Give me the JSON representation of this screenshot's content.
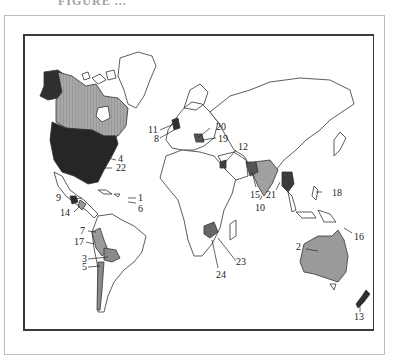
{
  "header": {
    "text": "FIGURE ..."
  },
  "map": {
    "title": "World map with numbered countries",
    "shading": {
      "dark": "#2b2b2b",
      "medium": "#8a8a8a",
      "light": "#b5b5b5",
      "outline": "#333333"
    },
    "labels": [
      {
        "id": "1",
        "text": "1"
      },
      {
        "id": "2",
        "text": "2"
      },
      {
        "id": "3",
        "text": "3"
      },
      {
        "id": "4",
        "text": "4"
      },
      {
        "id": "5",
        "text": "5"
      },
      {
        "id": "6",
        "text": "6"
      },
      {
        "id": "7",
        "text": "7"
      },
      {
        "id": "8",
        "text": "8"
      },
      {
        "id": "9",
        "text": "9"
      },
      {
        "id": "10",
        "text": "10"
      },
      {
        "id": "11",
        "text": "11"
      },
      {
        "id": "12",
        "text": "12"
      },
      {
        "id": "13",
        "text": "13"
      },
      {
        "id": "14",
        "text": "14"
      },
      {
        "id": "15",
        "text": "15"
      },
      {
        "id": "16",
        "text": "16"
      },
      {
        "id": "17",
        "text": "17"
      },
      {
        "id": "18",
        "text": "18"
      },
      {
        "id": "19",
        "text": "19"
      },
      {
        "id": "20",
        "text": "20"
      },
      {
        "id": "21",
        "text": "21"
      },
      {
        "id": "22",
        "text": "22"
      },
      {
        "id": "23",
        "text": "23"
      },
      {
        "id": "24",
        "text": "24"
      }
    ]
  }
}
